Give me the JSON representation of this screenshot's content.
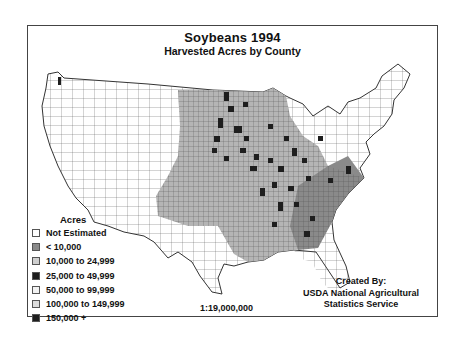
{
  "map": {
    "title": "Soybeans 1994",
    "subtitle": "Harvested Acres by County",
    "scale": "1:19,000,000",
    "credit": [
      "Created By:",
      "USDA National Agricultural",
      "Statistics Service"
    ]
  },
  "legend": {
    "title": "Acres",
    "items": [
      {
        "label": "Not Estimated",
        "color": "#ffffff"
      },
      {
        "label": "< 10,000",
        "color": "#8a8a8a"
      },
      {
        "label": "10,000 to 24,999",
        "color": "#cfcfcf"
      },
      {
        "label": "25,000 to 49,999",
        "color": "#1e1e1e"
      },
      {
        "label": "50,000 to 99,999",
        "color": "#f2f2f2"
      },
      {
        "label": "100,000 to 149,999",
        "color": "#dcdcdc"
      },
      {
        "label": "150,000 +",
        "color": "#1e1e1e"
      }
    ]
  },
  "colors": {
    "frame": "#444444",
    "outline": "#333333",
    "low": "#8a8a8a",
    "mid": "#cfcfcf",
    "dark": "#1e1e1e"
  }
}
